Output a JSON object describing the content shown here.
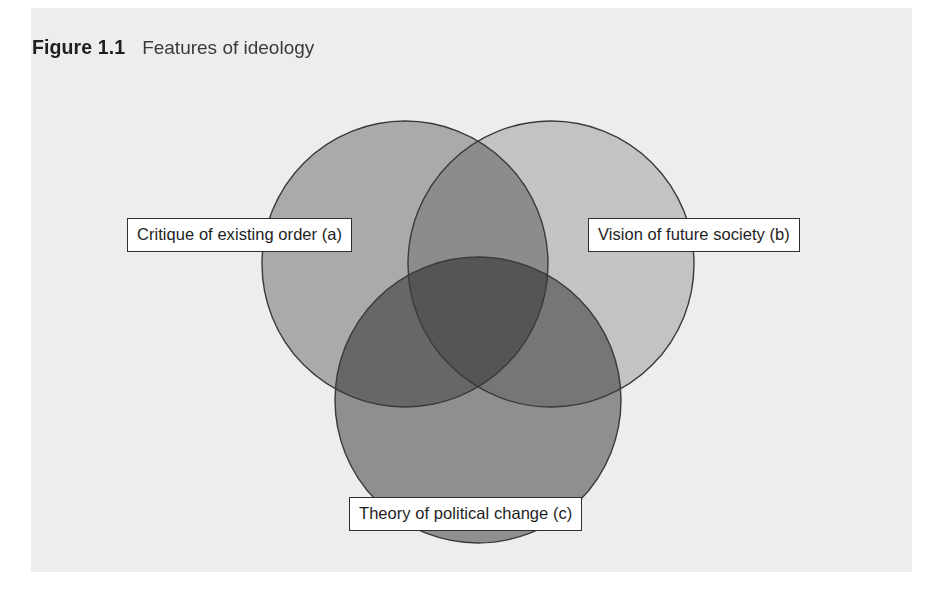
{
  "figure": {
    "number": "Figure 1.1",
    "title": "Features of ideology",
    "panel_background": "#ededed",
    "page_background": "#ffffff"
  },
  "diagram": {
    "type": "venn-3-circle",
    "outline_color": "#3a3a3a",
    "circles": [
      {
        "id": "a",
        "label": "Critique of existing order (a)",
        "fill": "#b7b7b7",
        "cx": 405,
        "cy": 264,
        "r": 143
      },
      {
        "id": "b",
        "label": "Vision of future society (b)",
        "fill": "#d2d2d2",
        "cx": 551,
        "cy": 264,
        "r": 143
      },
      {
        "id": "c",
        "label": "Theory of political change (c)",
        "fill": "#9a9a9a",
        "cx": 478,
        "cy": 400,
        "r": 143
      }
    ],
    "labels": {
      "a": "Critique of existing order (a)",
      "b": "Vision of future society (b)",
      "c": "Theory of political change (c)"
    }
  },
  "chart_data": {
    "type": "diagram",
    "subtype": "venn",
    "title": "Features of ideology",
    "sets": [
      {
        "key": "a",
        "name": "Critique of existing order",
        "tone": "medium-gray"
      },
      {
        "key": "b",
        "name": "Vision of future society",
        "tone": "light-gray"
      },
      {
        "key": "c",
        "name": "Theory of political change",
        "tone": "dark-gray"
      }
    ],
    "regions": [
      "a only",
      "b only",
      "c only",
      "a ∩ b",
      "a ∩ c",
      "b ∩ c",
      "a ∩ b ∩ c"
    ],
    "legend": "none",
    "grid": false
  }
}
